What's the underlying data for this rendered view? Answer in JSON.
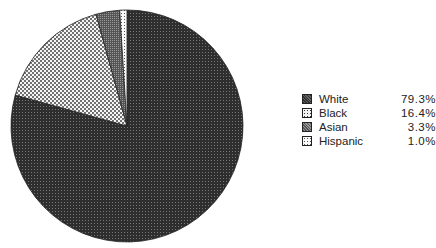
{
  "chart_data": {
    "type": "pie",
    "title": "",
    "start_angle": "12 o'clock, clockwise",
    "categories": [
      "White",
      "Black",
      "Asian",
      "Hispanic"
    ],
    "values": [
      79.3,
      16.4,
      3.3,
      1.0
    ],
    "value_labels": [
      "79.3%",
      "16.4%",
      "3.3%",
      "1.0%"
    ],
    "legend_position": "right"
  },
  "legend": {
    "items": [
      {
        "label": "White",
        "value": "79.3%",
        "pattern": "dark-dither"
      },
      {
        "label": "Black",
        "value": "16.4%",
        "pattern": "dots-light"
      },
      {
        "label": "Asian",
        "value": "3.3%",
        "pattern": "medium-dither"
      },
      {
        "label": "Hispanic",
        "value": "1.0%",
        "pattern": "sparse-dots"
      }
    ]
  },
  "colors": {
    "white_slice": "#3a3a3a",
    "black_slice": "#d8d8d8",
    "asian_slice": "#6a6a6a",
    "hispanic_slice": "#f0f0f0",
    "outline": "#222222"
  }
}
